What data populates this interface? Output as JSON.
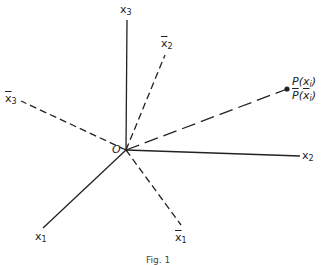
{
  "diagram": {
    "type": "coordinate-axes",
    "origin": {
      "label": "O",
      "x": 126,
      "y": 150
    },
    "solid_axes": [
      {
        "name": "x1",
        "label": "x",
        "sub": "1",
        "end": [
          43,
          228
        ]
      },
      {
        "name": "x2",
        "label": "x",
        "sub": "2",
        "end": [
          300,
          156
        ]
      },
      {
        "name": "x3",
        "label": "x",
        "sub": "3",
        "end": [
          127,
          20
        ]
      }
    ],
    "dashed_axes": [
      {
        "name": "x1bar",
        "label": "x",
        "sub": "1",
        "end": [
          181,
          225
        ]
      },
      {
        "name": "x2bar",
        "label": "x",
        "sub": "2",
        "end": [
          165,
          55
        ]
      },
      {
        "name": "x3bar",
        "label": "x",
        "sub": "3",
        "end": [
          21,
          101
        ]
      }
    ],
    "point": {
      "label_p": "P",
      "label_p_arg": "x",
      "label_p_sub": "i",
      "label_pbar": "P",
      "label_pbar_arg": "x",
      "label_pbar_sub": "i",
      "x": 287,
      "y": 89
    },
    "caption": "Fig. 1"
  },
  "colors": {
    "line": "#222222",
    "background": "#ffffff"
  }
}
